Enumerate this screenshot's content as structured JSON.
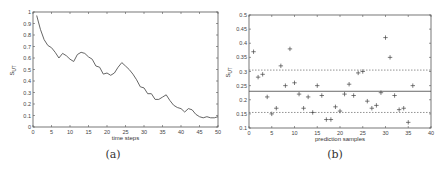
{
  "chart_data": [
    {
      "id": "a",
      "type": "line",
      "caption": "(a)",
      "title": "",
      "xlabel": "time steps",
      "ylabel": "S_UT",
      "xlim": [
        0,
        50
      ],
      "ylim": [
        0,
        1
      ],
      "xticks": [
        0,
        5,
        10,
        15,
        20,
        25,
        30,
        35,
        40,
        45,
        50
      ],
      "yticks": [
        0,
        0.1,
        0.2,
        0.3,
        0.4,
        0.5,
        0.6,
        0.7,
        0.8,
        0.9,
        1
      ],
      "grid": false,
      "legend": null,
      "x": [
        1,
        2,
        3,
        4,
        5,
        6,
        7,
        8,
        9,
        10,
        11,
        12,
        13,
        14,
        15,
        16,
        17,
        18,
        19,
        20,
        21,
        22,
        23,
        24,
        25,
        26,
        27,
        28,
        29,
        30,
        31,
        32,
        33,
        34,
        35,
        36,
        37,
        38,
        39,
        40,
        41,
        42,
        43,
        44,
        45,
        46,
        47,
        48,
        49,
        50
      ],
      "series": [
        {
          "name": "S_UT",
          "color": "#555555",
          "values": [
            0.97,
            0.85,
            0.76,
            0.71,
            0.69,
            0.65,
            0.6,
            0.64,
            0.62,
            0.59,
            0.57,
            0.63,
            0.65,
            0.64,
            0.61,
            0.59,
            0.53,
            0.52,
            0.46,
            0.47,
            0.45,
            0.47,
            0.52,
            0.56,
            0.53,
            0.5,
            0.46,
            0.41,
            0.35,
            0.34,
            0.29,
            0.29,
            0.24,
            0.24,
            0.26,
            0.28,
            0.23,
            0.19,
            0.17,
            0.16,
            0.13,
            0.16,
            0.15,
            0.11,
            0.09,
            0.08,
            0.09,
            0.08,
            0.08,
            0.09
          ]
        }
      ]
    },
    {
      "id": "b",
      "type": "scatter",
      "caption": "(b)",
      "title": "",
      "xlabel": "prediction samples",
      "ylabel": "S_UT",
      "xlim": [
        0,
        40
      ],
      "ylim": [
        0.1,
        0.5
      ],
      "xticks": [
        0,
        5,
        10,
        15,
        20,
        25,
        30,
        35,
        40
      ],
      "yticks": [
        0.1,
        0.15,
        0.2,
        0.25,
        0.3,
        0.35,
        0.4,
        0.45,
        0.5
      ],
      "grid": false,
      "legend": null,
      "marker": "+",
      "reference_lines": [
        {
          "name": "mean",
          "y": 0.23,
          "style": "solid"
        },
        {
          "name": "upper",
          "y": 0.305,
          "style": "dotted"
        },
        {
          "name": "lower",
          "y": 0.155,
          "style": "dotted"
        }
      ],
      "x": [
        1,
        2,
        3,
        4,
        5,
        6,
        7,
        8,
        9,
        10,
        11,
        12,
        13,
        14,
        15,
        16,
        17,
        18,
        19,
        20,
        21,
        22,
        23,
        24,
        25,
        26,
        27,
        28,
        29,
        30,
        31,
        32,
        33,
        34,
        35,
        36
      ],
      "series": [
        {
          "name": "samples",
          "color": "#444444",
          "values": [
            0.37,
            0.28,
            0.29,
            0.21,
            0.15,
            0.17,
            0.32,
            0.25,
            0.38,
            0.26,
            0.22,
            0.17,
            0.21,
            0.155,
            0.25,
            0.215,
            0.13,
            0.13,
            0.175,
            0.16,
            0.22,
            0.255,
            0.215,
            0.295,
            0.3,
            0.195,
            0.17,
            0.18,
            0.225,
            0.42,
            0.35,
            0.215,
            0.165,
            0.17,
            0.12,
            0.25
          ]
        }
      ]
    }
  ]
}
